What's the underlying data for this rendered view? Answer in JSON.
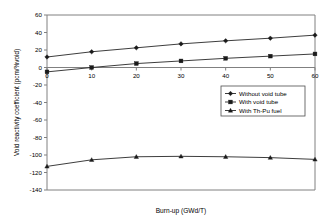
{
  "chart_data": {
    "type": "line",
    "title": "",
    "xlabel": "Burn-up (GWd/T)",
    "ylabel": "Void reactivity coefficient (pcm/%void)",
    "x": [
      0,
      10,
      20,
      30,
      40,
      50,
      60
    ],
    "xlim": [
      0,
      60
    ],
    "ylim": [
      -140,
      60
    ],
    "xticks": [
      "0",
      "10",
      "20",
      "30",
      "40",
      "50",
      "60"
    ],
    "yticks": [
      "60",
      "40",
      "20",
      "0",
      "-20",
      "-40",
      "-60",
      "-80",
      "-100",
      "-120",
      "-140"
    ],
    "grid": false,
    "legend_position": "center-right",
    "series": [
      {
        "name": "Without void tube",
        "marker": "diamond",
        "values": [
          12,
          18,
          22.5,
          27,
          30.5,
          33.5,
          37
        ]
      },
      {
        "name": "With void tube",
        "marker": "square",
        "values": [
          -5,
          0,
          4.5,
          7.5,
          10.5,
          13,
          15.5
        ]
      },
      {
        "name": "With Th-Pu fuel",
        "marker": "triangle",
        "values": [
          -113,
          -105.5,
          -102,
          -101.5,
          -102,
          -103,
          -105
        ]
      }
    ]
  },
  "legend": {
    "items": [
      {
        "label": "Without void tube"
      },
      {
        "label": "With void tube"
      },
      {
        "label": "With Th-Pu fuel"
      }
    ]
  }
}
